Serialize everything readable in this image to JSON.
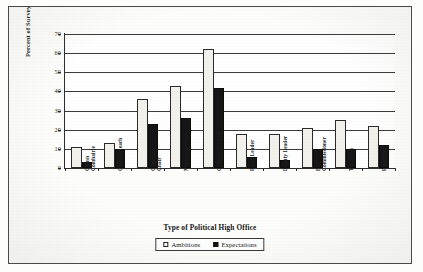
{
  "chart_data": {
    "type": "bar",
    "title": "",
    "xlabel": "Type of Political High Office",
    "ylabel": "Percent of Survey",
    "ylim": [
      0,
      70
    ],
    "ytick_values": [
      0,
      10,
      20,
      30,
      40,
      50,
      60,
      70
    ],
    "ytick_labels": [
      "0",
      "10",
      "20",
      "30",
      "40",
      "50",
      "60",
      "70"
    ],
    "grid": true,
    "legend_position": "below-plot",
    "categories": [
      "Ceann Comhairle",
      "Cathaoirleach",
      "Committee Chair",
      "Minister of State",
      "Cabinet Minister",
      "Party Leader",
      "Deputy Leader",
      "EU Commissioner",
      "Taoiseach",
      "President"
    ],
    "category_lines": [
      [
        "Ceann",
        "Comhairle"
      ],
      [
        "Cathaoirleach",
        ""
      ],
      [
        "Committee",
        "Chair"
      ],
      [
        "Minister of State",
        ""
      ],
      [
        "Cabinet Minister",
        ""
      ],
      [
        "Party Leader",
        ""
      ],
      [
        "Deputy Leader",
        ""
      ],
      [
        "EU",
        "Commissioner"
      ],
      [
        "Taoiseach",
        ""
      ],
      [
        "President",
        ""
      ]
    ],
    "series": [
      {
        "name": "Ambitions",
        "color": "#f2f1ec",
        "values": [
          11,
          13,
          36,
          43,
          62,
          18,
          18,
          21,
          25,
          22
        ]
      },
      {
        "name": "Expectations",
        "color": "#151515",
        "values": [
          3,
          10,
          23,
          26,
          42,
          6,
          4,
          10,
          10,
          12
        ]
      }
    ]
  },
  "legend": {
    "items": [
      {
        "label": "Ambitions",
        "swatch": "open-square-icon"
      },
      {
        "label": "Expectations",
        "swatch": "filled-square-icon"
      }
    ]
  }
}
